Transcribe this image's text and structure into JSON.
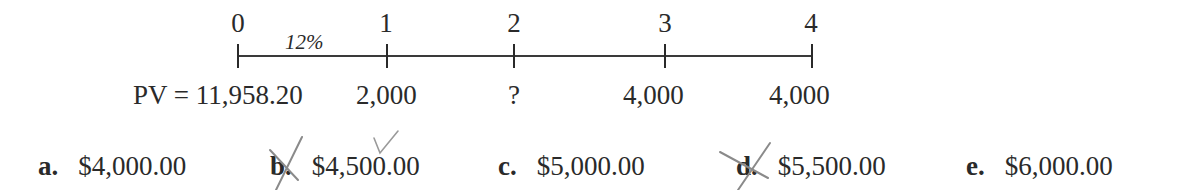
{
  "timeline": {
    "rate_label": "12%",
    "periods": [
      "0",
      "1",
      "2",
      "3",
      "4"
    ],
    "cash_flows": {
      "pv": "PV = 11,958.20",
      "cf1": "2,000",
      "cf2": "?",
      "cf3": "4,000",
      "cf4": "4,000"
    }
  },
  "choices": [
    {
      "letter": "a.",
      "value": "$4,000.00",
      "marked": "none"
    },
    {
      "letter": "b.",
      "value": "$4,500.00",
      "marked": "crossed-out-letter, check-above-value"
    },
    {
      "letter": "c.",
      "value": "$5,000.00",
      "marked": "none"
    },
    {
      "letter": "d.",
      "value": "$5,500.00",
      "marked": "crossed-out"
    },
    {
      "letter": "e.",
      "value": "$6,000.00",
      "marked": "none"
    }
  ],
  "colors": {
    "ink": "#2a2a2a",
    "pencil": "#8a8a8a"
  }
}
